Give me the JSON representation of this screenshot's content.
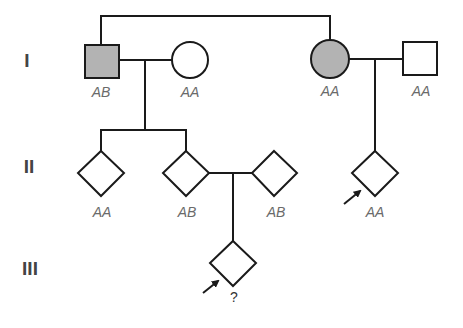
{
  "colors": {
    "affected_fill": "#b3b3b3",
    "unaffected_fill": "#ffffff",
    "stroke": "#1a1a1a",
    "label": "#6a6a6a",
    "generation_label": "#444444"
  },
  "generations": [
    {
      "label": "I"
    },
    {
      "label": "II"
    },
    {
      "label": "III"
    }
  ],
  "individuals": {
    "I_1": {
      "shape": "square",
      "sex": "male",
      "affected": true,
      "genotype": "AB"
    },
    "I_2": {
      "shape": "circle",
      "sex": "female",
      "affected": false,
      "genotype": "AA"
    },
    "I_3": {
      "shape": "circle",
      "sex": "female",
      "affected": true,
      "genotype": "AA"
    },
    "I_4": {
      "shape": "square",
      "sex": "male",
      "affected": false,
      "genotype": "AA"
    },
    "II_1": {
      "shape": "diamond",
      "sex": "unknown",
      "affected": false,
      "genotype": "AA"
    },
    "II_2": {
      "shape": "diamond",
      "sex": "unknown",
      "affected": false,
      "genotype": "AB"
    },
    "II_3": {
      "shape": "diamond",
      "sex": "unknown",
      "affected": false,
      "genotype": "AB"
    },
    "II_4": {
      "shape": "diamond",
      "sex": "unknown",
      "affected": false,
      "genotype": "AA",
      "proband_arrow": true
    },
    "III_1": {
      "shape": "diamond",
      "sex": "unknown",
      "affected": false,
      "genotype": "?",
      "proband_arrow": true
    }
  },
  "relationships": [
    {
      "type": "sibling",
      "members": [
        "I_1",
        "I_3"
      ]
    },
    {
      "type": "mating",
      "members": [
        "I_1",
        "I_2"
      ],
      "children": [
        "II_1",
        "II_2"
      ]
    },
    {
      "type": "mating",
      "members": [
        "I_3",
        "I_4"
      ],
      "children": [
        "II_4"
      ]
    },
    {
      "type": "mating",
      "members": [
        "II_2",
        "II_3"
      ],
      "children": [
        "III_1"
      ]
    }
  ]
}
